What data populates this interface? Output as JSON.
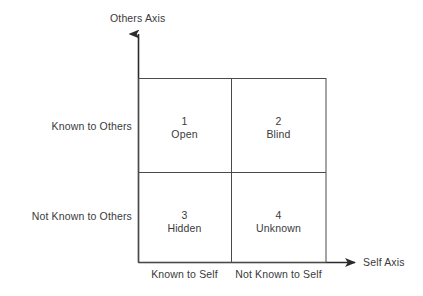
{
  "figure": {
    "kind": "johari-window",
    "background_color": "#ffffff",
    "line_color": "#3a3a3a",
    "text_color": "#3a3a3a"
  },
  "axes": {
    "vertical": {
      "title": "Others Axis",
      "arrow": "up"
    },
    "horizontal": {
      "title": "Self Axis",
      "arrow": "right"
    }
  },
  "row_labels": [
    {
      "label": "Known to Others"
    },
    {
      "label": "Not Known to Others"
    }
  ],
  "column_labels": [
    {
      "label": "Known to Self"
    },
    {
      "label": "Not Known to Self"
    }
  ],
  "quadrants": [
    {
      "number": "1",
      "name": "Open"
    },
    {
      "number": "2",
      "name": "Blind"
    },
    {
      "number": "3",
      "name": "Hidden"
    },
    {
      "number": "4",
      "name": "Unknown"
    }
  ]
}
